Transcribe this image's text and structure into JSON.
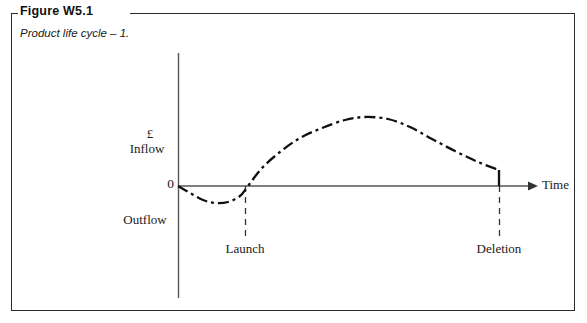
{
  "figure": {
    "title": "Figure W5.1",
    "subtitle": "Product life cycle – 1."
  },
  "chart_data": {
    "type": "line",
    "title": "Product life cycle – 1.",
    "xlabel": "Time",
    "ylabel": "£",
    "axis_labels": {
      "currency": "£",
      "inflow": "Inflow",
      "zero": "0",
      "outflow": "Outflow",
      "time": "Time"
    },
    "annotations": [
      {
        "label": "Launch",
        "x_px": 245
      },
      {
        "label": "Deletion",
        "x_px": 499
      }
    ],
    "legend": [],
    "grid": false,
    "series": [
      {
        "name": "Net cash flow",
        "style": "dash-dot",
        "color": "#111111",
        "points": [
          {
            "x": 178,
            "y": 186
          },
          {
            "x": 190,
            "y": 193
          },
          {
            "x": 203,
            "y": 200
          },
          {
            "x": 215,
            "y": 203
          },
          {
            "x": 228,
            "y": 202
          },
          {
            "x": 240,
            "y": 196
          },
          {
            "x": 248,
            "y": 186
          },
          {
            "x": 262,
            "y": 168
          },
          {
            "x": 280,
            "y": 152
          },
          {
            "x": 300,
            "y": 138
          },
          {
            "x": 322,
            "y": 128
          },
          {
            "x": 345,
            "y": 120
          },
          {
            "x": 365,
            "y": 117
          },
          {
            "x": 388,
            "y": 119
          },
          {
            "x": 410,
            "y": 127
          },
          {
            "x": 432,
            "y": 139
          },
          {
            "x": 455,
            "y": 151
          },
          {
            "x": 478,
            "y": 162
          },
          {
            "x": 499,
            "y": 170
          },
          {
            "x": 499,
            "y": 186
          }
        ]
      }
    ],
    "axes": {
      "y_axis": {
        "x_px": 178,
        "top_px": 53,
        "bottom_px": 298
      },
      "x_axis": {
        "y_px": 186,
        "left_px": 178,
        "right_px": 536,
        "arrow": true
      }
    }
  }
}
